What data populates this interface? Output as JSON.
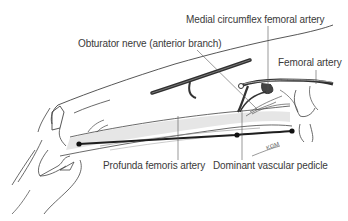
{
  "figure": {
    "labels": {
      "medial_circumflex": "Medial circumflex femoral artery",
      "obturator_nerve": "Obturator nerve (anterior branch)",
      "femoral_artery": "Femoral artery",
      "profunda": "Profunda femoris artery",
      "dominant_pedicle": "Dominant vascular pedicle"
    },
    "signature": "KGM",
    "colors": {
      "line": "#2a2a2a",
      "vessel": "#3c3c3c",
      "shade": "#cfcfcf",
      "text": "#3a3a3a"
    }
  }
}
